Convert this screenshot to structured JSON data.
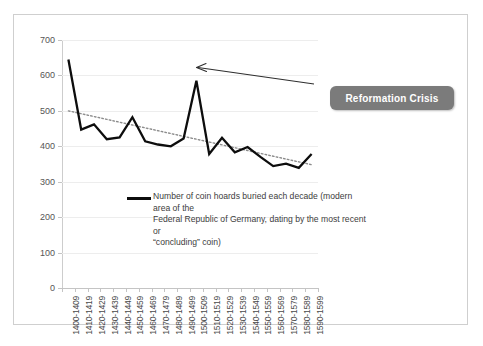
{
  "chart_data": {
    "type": "line",
    "title": "",
    "xlabel": "",
    "ylabel": "",
    "ylim": [
      0,
      700
    ],
    "ytick_step": 100,
    "yticks": [
      0,
      100,
      200,
      300,
      400,
      500,
      600,
      700
    ],
    "grid": true,
    "legend_position": "inside-center",
    "categories": [
      "1400-1409",
      "1410-1419",
      "1420-1429",
      "1430-1439",
      "1440-1449",
      "1450-1459",
      "1460-1469",
      "1470-1479",
      "1480-1489",
      "1490-1499",
      "1500-1509",
      "1510-1519",
      "1520-1529",
      "1530-1539",
      "1540-1549",
      "1550-1559",
      "1560-1569",
      "1570-1579",
      "1580-1589",
      "1590-1599"
    ],
    "series": [
      {
        "name": "Number of coin hoards buried each decade (modern area of the Federal Republic of Germany, dating by the most recent or \"concluding\" coin)",
        "style": "solid",
        "color": "#0d0d0d",
        "values": [
          645,
          447,
          462,
          420,
          425,
          482,
          414,
          405,
          400,
          422,
          585,
          378,
          424,
          383,
          398,
          370,
          344,
          351,
          339,
          378
        ]
      },
      {
        "name": "trendline",
        "style": "dotted",
        "color": "#8c8c8c",
        "values": [
          500,
          492,
          484,
          476,
          468,
          460,
          452,
          444,
          436,
          428,
          420,
          412,
          404,
          396,
          388,
          380,
          372,
          364,
          356,
          348
        ]
      }
    ],
    "annotations": [
      {
        "label": "Reformation Crisis",
        "points_to_category": "1500-1509",
        "points_to_value": 585,
        "box_color": "#7b7b7b",
        "text_color": "#ffffff",
        "arrow_color": "#2e2e2e"
      }
    ]
  },
  "legend": {
    "line1": "Number of coin hoards buried each decade (modern area of the",
    "line2": "Federal Republic of Germany, dating by the most recent or",
    "line3": "“concluding” coin)"
  },
  "callout": {
    "label": "Reformation Crisis"
  },
  "colors": {
    "series_line": "#0d0d0d",
    "trendline": "#8c8c8c",
    "gridline": "#ededed",
    "axis": "#c4c4c4",
    "frame_border": "#cfcfcf",
    "callout_bg": "#7b7b7b",
    "callout_text": "#ffffff",
    "background": "#ffffff"
  }
}
